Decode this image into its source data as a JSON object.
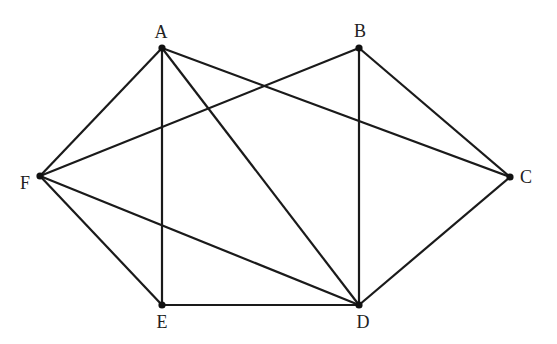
{
  "diagram": {
    "type": "graph",
    "nodes": [
      {
        "id": "A",
        "label": "A",
        "x": 162,
        "y": 48,
        "lx": 161,
        "ly": 38,
        "anchor": "middle"
      },
      {
        "id": "B",
        "label": "B",
        "x": 359,
        "y": 48,
        "lx": 360,
        "ly": 37,
        "anchor": "middle"
      },
      {
        "id": "C",
        "label": "C",
        "x": 510,
        "y": 177,
        "lx": 520,
        "ly": 183,
        "anchor": "start"
      },
      {
        "id": "D",
        "label": "D",
        "x": 359,
        "y": 305,
        "lx": 363,
        "ly": 328,
        "anchor": "middle"
      },
      {
        "id": "E",
        "label": "E",
        "x": 162,
        "y": 305,
        "lx": 162,
        "ly": 328,
        "anchor": "middle"
      },
      {
        "id": "F",
        "label": "F",
        "x": 40,
        "y": 176,
        "lx": 30,
        "ly": 189,
        "anchor": "end"
      }
    ],
    "edges": [
      [
        "A",
        "F"
      ],
      [
        "A",
        "E"
      ],
      [
        "A",
        "D"
      ],
      [
        "A",
        "C"
      ],
      [
        "B",
        "F"
      ],
      [
        "B",
        "D"
      ],
      [
        "B",
        "C"
      ],
      [
        "C",
        "D"
      ],
      [
        "F",
        "D"
      ],
      [
        "F",
        "E"
      ],
      [
        "E",
        "D"
      ]
    ],
    "colors": {
      "edge": "#1a1a1a",
      "node": "#111111",
      "label": "#222222"
    }
  }
}
